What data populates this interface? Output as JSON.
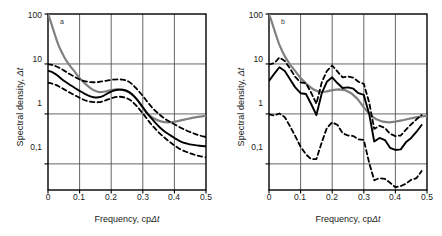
{
  "figure": {
    "background": "#ffffff",
    "axis_color": "#000000",
    "grid_color": "#555555",
    "theoretical_color": "#808080",
    "estimate_color": "#000000",
    "bounds_color": "#000000"
  },
  "axes": {
    "ylabel_prefix": "Spectral density, ",
    "ylabel_symbol": "Δt",
    "xlabel_prefix": "Frequency, cp",
    "xlabel_symbol": "Δt",
    "yticks": [
      "100",
      "10",
      "1",
      "0,1"
    ],
    "ytick_values": [
      100,
      10,
      1,
      0.1
    ],
    "xticks": [
      "0",
      "0.1",
      "0.2",
      "0.3",
      "0.4",
      "0.5"
    ],
    "xtick_values": [
      0,
      0.1,
      0.2,
      0.3,
      0.4,
      0.5
    ],
    "ylim": [
      0.03,
      100
    ],
    "xlim": [
      0,
      0.5
    ],
    "yscale": "log",
    "xscale": "linear",
    "grid": true
  },
  "panels": [
    {
      "tag": "a",
      "id": "panel-a"
    },
    {
      "tag": "b",
      "id": "panel-b"
    }
  ],
  "chart_data": [
    {
      "type": "line",
      "title": "a",
      "xlabel": "Frequency, cpΔt",
      "ylabel": "Spectral density, Δt",
      "xlim": [
        0,
        0.5
      ],
      "ylim": [
        0.03,
        100
      ],
      "yscale": "log",
      "grid": true,
      "legend": "none",
      "series": [
        {
          "name": "theoretical spectrum",
          "style": "solid",
          "color": "#808080",
          "width": 2.2,
          "x": [
            0.0,
            0.008,
            0.016,
            0.024,
            0.032,
            0.042,
            0.052,
            0.065,
            0.08,
            0.1,
            0.12,
            0.14,
            0.16,
            0.18,
            0.2,
            0.22,
            0.24,
            0.26,
            0.28,
            0.3,
            0.32,
            0.34,
            0.36,
            0.38,
            0.4,
            0.42,
            0.44,
            0.46,
            0.48,
            0.5
          ],
          "y": [
            100.0,
            72.0,
            50.0,
            35.0,
            25.0,
            18.0,
            13.5,
            10.0,
            7.6,
            5.2,
            3.9,
            3.1,
            2.75,
            2.8,
            3.0,
            3.1,
            3.0,
            2.6,
            2.0,
            1.35,
            0.95,
            0.78,
            0.7,
            0.68,
            0.7,
            0.74,
            0.79,
            0.84,
            0.88,
            0.92
          ]
        },
        {
          "name": "spectrum estimate",
          "style": "solid",
          "color": "#000000",
          "width": 1.9,
          "x": [
            0.0,
            0.01,
            0.02,
            0.03,
            0.04,
            0.055,
            0.07,
            0.085,
            0.1,
            0.115,
            0.13,
            0.145,
            0.16,
            0.175,
            0.19,
            0.205,
            0.22,
            0.235,
            0.25,
            0.265,
            0.28,
            0.295,
            0.31,
            0.325,
            0.34,
            0.355,
            0.37,
            0.385,
            0.4,
            0.42,
            0.44,
            0.46,
            0.48,
            0.5
          ],
          "y": [
            7.3,
            7.0,
            6.5,
            5.9,
            5.2,
            4.4,
            3.8,
            3.3,
            2.9,
            2.55,
            2.3,
            2.15,
            2.15,
            2.3,
            2.6,
            2.9,
            3.05,
            3.05,
            2.9,
            2.5,
            2.0,
            1.5,
            1.1,
            0.85,
            0.66,
            0.53,
            0.44,
            0.38,
            0.33,
            0.28,
            0.255,
            0.24,
            0.23,
            0.225
          ]
        },
        {
          "name": "upper confidence bound",
          "style": "dashed",
          "color": "#000000",
          "width": 1.8,
          "x": [
            0.0,
            0.012,
            0.025,
            0.04,
            0.055,
            0.07,
            0.085,
            0.1,
            0.115,
            0.13,
            0.145,
            0.16,
            0.175,
            0.19,
            0.205,
            0.22,
            0.235,
            0.25,
            0.265,
            0.28,
            0.295,
            0.31,
            0.325,
            0.34,
            0.355,
            0.37,
            0.385,
            0.4,
            0.42,
            0.44,
            0.46,
            0.48,
            0.5
          ],
          "y": [
            9.9,
            9.6,
            9.0,
            8.1,
            7.1,
            6.2,
            5.5,
            4.9,
            4.55,
            4.35,
            4.3,
            4.35,
            4.5,
            4.7,
            4.85,
            4.9,
            4.85,
            4.6,
            4.0,
            3.2,
            2.5,
            1.9,
            1.45,
            1.15,
            0.95,
            0.8,
            0.7,
            0.62,
            0.53,
            0.46,
            0.41,
            0.37,
            0.345
          ]
        },
        {
          "name": "lower confidence bound",
          "style": "dashed",
          "color": "#000000",
          "width": 1.8,
          "x": [
            0.0,
            0.012,
            0.025,
            0.04,
            0.055,
            0.07,
            0.085,
            0.1,
            0.115,
            0.13,
            0.145,
            0.16,
            0.175,
            0.19,
            0.205,
            0.22,
            0.235,
            0.25,
            0.265,
            0.28,
            0.295,
            0.31,
            0.325,
            0.34,
            0.355,
            0.37,
            0.385,
            0.4,
            0.42,
            0.44,
            0.46,
            0.48,
            0.5
          ],
          "y": [
            4.2,
            4.05,
            3.8,
            3.4,
            3.0,
            2.65,
            2.35,
            2.1,
            1.9,
            1.78,
            1.72,
            1.72,
            1.8,
            1.95,
            2.1,
            2.2,
            2.18,
            2.05,
            1.8,
            1.45,
            1.12,
            0.85,
            0.64,
            0.5,
            0.4,
            0.33,
            0.275,
            0.235,
            0.195,
            0.172,
            0.155,
            0.143,
            0.135
          ]
        }
      ]
    },
    {
      "type": "line",
      "title": "b",
      "xlabel": "Frequency, cpΔt",
      "ylabel": "Spectral density, Δt",
      "xlim": [
        0,
        0.5
      ],
      "ylim": [
        0.03,
        100
      ],
      "yscale": "log",
      "grid": true,
      "legend": "none",
      "series": [
        {
          "name": "theoretical spectrum",
          "style": "solid",
          "color": "#808080",
          "width": 2.2,
          "x": [
            0.0,
            0.008,
            0.016,
            0.024,
            0.032,
            0.042,
            0.052,
            0.065,
            0.08,
            0.1,
            0.12,
            0.14,
            0.16,
            0.18,
            0.2,
            0.22,
            0.24,
            0.26,
            0.28,
            0.3,
            0.32,
            0.34,
            0.36,
            0.38,
            0.4,
            0.42,
            0.44,
            0.46,
            0.48,
            0.5
          ],
          "y": [
            100.0,
            72.0,
            50.0,
            35.0,
            25.0,
            18.0,
            13.5,
            10.0,
            7.6,
            5.2,
            3.9,
            3.1,
            2.75,
            2.8,
            3.0,
            3.1,
            3.0,
            2.6,
            2.0,
            1.35,
            0.95,
            0.78,
            0.7,
            0.68,
            0.7,
            0.74,
            0.79,
            0.84,
            0.88,
            0.92
          ]
        },
        {
          "name": "spectrum estimate",
          "style": "solid",
          "color": "#000000",
          "width": 1.9,
          "x": [
            0.0,
            0.017,
            0.033,
            0.05,
            0.067,
            0.083,
            0.1,
            0.117,
            0.133,
            0.15,
            0.167,
            0.183,
            0.2,
            0.217,
            0.233,
            0.25,
            0.267,
            0.283,
            0.3,
            0.317,
            0.333,
            0.35,
            0.367,
            0.383,
            0.4,
            0.417,
            0.433,
            0.45,
            0.467,
            0.483
          ],
          "y": [
            4.6,
            6.4,
            8.6,
            7.2,
            4.9,
            3.4,
            2.6,
            2.5,
            1.6,
            0.95,
            2.6,
            4.4,
            5.4,
            4.1,
            3.3,
            3.4,
            3.2,
            2.6,
            2.4,
            1.0,
            0.28,
            0.33,
            0.3,
            0.21,
            0.19,
            0.195,
            0.27,
            0.33,
            0.44,
            0.6
          ]
        },
        {
          "name": "upper confidence bound",
          "style": "dashed",
          "color": "#000000",
          "width": 1.8,
          "x": [
            0.0,
            0.017,
            0.033,
            0.05,
            0.067,
            0.083,
            0.1,
            0.117,
            0.133,
            0.15,
            0.167,
            0.183,
            0.2,
            0.217,
            0.233,
            0.25,
            0.267,
            0.283,
            0.3,
            0.317,
            0.333,
            0.35,
            0.367,
            0.383,
            0.4,
            0.417,
            0.433,
            0.45,
            0.467,
            0.483
          ],
          "y": [
            9.8,
            10.4,
            13.5,
            11.5,
            8.0,
            5.5,
            4.3,
            4.1,
            2.7,
            1.6,
            4.3,
            7.2,
            9.3,
            7.0,
            5.4,
            5.6,
            5.3,
            4.4,
            4.0,
            1.7,
            0.5,
            0.58,
            0.52,
            0.4,
            0.36,
            0.37,
            0.48,
            0.62,
            0.78,
            0.95
          ]
        },
        {
          "name": "lower confidence bound",
          "style": "dashed",
          "color": "#000000",
          "width": 1.8,
          "x": [
            0.0,
            0.017,
            0.033,
            0.05,
            0.067,
            0.083,
            0.1,
            0.117,
            0.133,
            0.15,
            0.167,
            0.183,
            0.2,
            0.217,
            0.233,
            0.25,
            0.267,
            0.283,
            0.3,
            0.317,
            0.333,
            0.35,
            0.367,
            0.383,
            0.4,
            0.417,
            0.433,
            0.45,
            0.467,
            0.483
          ],
          "y": [
            0.98,
            0.93,
            1.02,
            0.86,
            0.56,
            0.36,
            0.22,
            0.155,
            0.125,
            0.125,
            0.27,
            0.52,
            0.68,
            0.6,
            0.41,
            0.37,
            0.36,
            0.31,
            0.3,
            0.105,
            0.047,
            0.052,
            0.05,
            0.042,
            0.034,
            0.036,
            0.04,
            0.048,
            0.052,
            0.072
          ]
        }
      ]
    }
  ]
}
